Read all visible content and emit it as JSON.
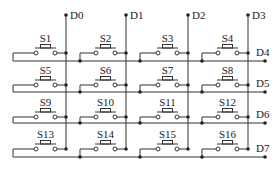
{
  "diagram": {
    "columns": [
      {
        "label": "D0",
        "x": 66
      },
      {
        "label": "D1",
        "x": 126
      },
      {
        "label": "D2",
        "x": 188
      },
      {
        "label": "D3",
        "x": 248
      }
    ],
    "rows": [
      {
        "label": "D4",
        "bus_y": 61,
        "switch_y": 53
      },
      {
        "label": "D5",
        "bus_y": 92,
        "switch_y": 85
      },
      {
        "label": "D6",
        "bus_y": 123,
        "switch_y": 117
      },
      {
        "label": "D7",
        "bus_y": 157,
        "switch_y": 149
      }
    ],
    "switches": [
      [
        "S1",
        "S2",
        "S3",
        "S4"
      ],
      [
        "S5",
        "S6",
        "S7",
        "S8"
      ],
      [
        "S9",
        "S10",
        "S11",
        "S12"
      ],
      [
        "S13",
        "S14",
        "S15",
        "S16"
      ]
    ],
    "colors": {
      "line": "#333333",
      "text": "#222222",
      "background": "#ffffff"
    }
  }
}
